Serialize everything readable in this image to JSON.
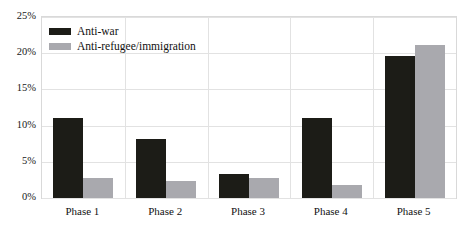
{
  "chart_data": {
    "type": "bar",
    "title": "",
    "subtitle": "",
    "xlabel": "",
    "ylabel": "",
    "categories": [
      "Phase 1",
      "Phase 2",
      "Phase 3",
      "Phase 4",
      "Phase 5"
    ],
    "series": [
      {
        "name": "Anti-war",
        "color": "#1c1c17",
        "values": [
          11.0,
          8.1,
          3.3,
          11.0,
          19.6
        ]
      },
      {
        "name": "Anti-refugee/immigration",
        "color": "#a9a9ae",
        "values": [
          2.8,
          2.3,
          2.8,
          1.8,
          21.2
        ]
      }
    ],
    "ylim": [
      0,
      25
    ],
    "yticks": [
      0,
      5,
      10,
      15,
      20,
      25
    ],
    "ytick_labels": [
      "0%",
      "5%",
      "10%",
      "15%",
      "20%",
      "25%"
    ],
    "grid": true,
    "legend_position": "top-left"
  },
  "legend": {
    "items": [
      {
        "label": "Anti-war",
        "color": "#1c1c17"
      },
      {
        "label": "Anti-refugee/immigration",
        "color": "#a9a9ae"
      }
    ]
  },
  "axes": {
    "y_labels": [
      "25%",
      "20%",
      "15%",
      "10%",
      "5%",
      "0%"
    ],
    "x_labels": [
      "Phase 1",
      "Phase 2",
      "Phase 3",
      "Phase 4",
      "Phase 5"
    ]
  }
}
